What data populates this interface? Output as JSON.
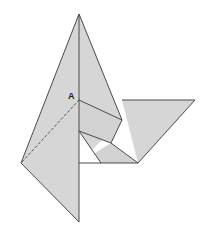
{
  "figure": {
    "canvas": {
      "width": 213,
      "height": 238
    },
    "background_color": "#ffffff",
    "fill_color": "#d6d6d6",
    "fill_color_dark": "#cdcdcd",
    "stroke_color": "#4a4a4a",
    "stroke_width": 1,
    "dashed_stroke_color": "#555555",
    "labels": [
      {
        "id": "point-a",
        "text": "A",
        "x": 68,
        "y": 99
      }
    ],
    "points": {
      "apex": [
        79,
        14
      ],
      "left": [
        21,
        163
      ],
      "bottom": [
        79,
        222
      ],
      "a": [
        79,
        100
      ],
      "mid_right": [
        122,
        120
      ],
      "right_tip": [
        195,
        100
      ],
      "right_bottom": [
        138,
        163
      ],
      "notch_top": [
        79,
        131
      ],
      "notch_right": [
        101,
        163
      ],
      "fold_right_top": [
        122,
        100
      ],
      "inner_low": [
        111,
        143
      ]
    },
    "shapes": [
      {
        "name": "left-large-kite",
        "kind": "polygon",
        "points": "79,14 21,163 79,222",
        "fill": "#d6d6d6"
      },
      {
        "name": "upper-right-flap",
        "kind": "polygon",
        "points": "79,14 122,120 79,163",
        "fill": "#d6d6d6"
      },
      {
        "name": "right-wing-triangle",
        "kind": "polygon",
        "points": "122,100 195,100 138,163",
        "fill": "#d6d6d6"
      },
      {
        "name": "center-lower-flap",
        "kind": "polygon",
        "points": "79,163 111,143 138,163",
        "fill": "#d2d2d2"
      },
      {
        "name": "inner-fold-band",
        "kind": "polygon",
        "points": "79,100 122,120 111,143 79,131",
        "fill": "#d2d2d2"
      },
      {
        "name": "notch-white-triangle",
        "kind": "polygon",
        "points": "79,131 101,163 79,163",
        "fill": "#ffffff"
      }
    ],
    "lines": [
      {
        "name": "edge-apex-left",
        "x1": 79,
        "y1": 14,
        "x2": 21,
        "y2": 163
      },
      {
        "name": "edge-left-bottom",
        "x1": 21,
        "y1": 163,
        "x2": 79,
        "y2": 222
      },
      {
        "name": "edge-center-vertical",
        "x1": 79,
        "y1": 14,
        "x2": 79,
        "y2": 222
      },
      {
        "name": "edge-apex-midright",
        "x1": 79,
        "y1": 14,
        "x2": 122,
        "y2": 120
      },
      {
        "name": "edge-a-midright",
        "x1": 79,
        "y1": 100,
        "x2": 122,
        "y2": 120
      },
      {
        "name": "edge-midright-inner",
        "x1": 122,
        "y1": 120,
        "x2": 111,
        "y2": 143
      },
      {
        "name": "edge-inner-notch",
        "x1": 111,
        "y1": 143,
        "x2": 79,
        "y2": 131
      },
      {
        "name": "edge-notch-diagonal",
        "x1": 79,
        "y1": 131,
        "x2": 101,
        "y2": 163
      },
      {
        "name": "edge-inner-rightbottom",
        "x1": 111,
        "y1": 143,
        "x2": 138,
        "y2": 163
      },
      {
        "name": "edge-bottom-horizontal",
        "x1": 79,
        "y1": 163,
        "x2": 138,
        "y2": 163
      },
      {
        "name": "edge-wing-top",
        "x1": 122,
        "y1": 100,
        "x2": 195,
        "y2": 100
      },
      {
        "name": "edge-wing-hypotenuse",
        "x1": 195,
        "y1": 100,
        "x2": 138,
        "y2": 163
      },
      {
        "name": "edge-wing-left",
        "x1": 122,
        "y1": 100,
        "x2": 122,
        "y2": 120
      }
    ],
    "dashed_lines": [
      {
        "name": "fold-crease-a-to-left",
        "x1": 79,
        "y1": 100,
        "x2": 21,
        "y2": 163
      }
    ]
  }
}
